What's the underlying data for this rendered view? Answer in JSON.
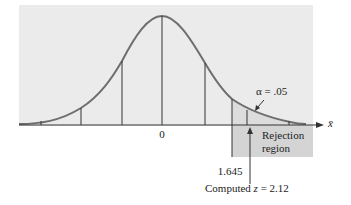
{
  "diagram": {
    "type": "normal-distribution-hypothesis-test",
    "axis_variable": "x̄",
    "center_label": "0",
    "alpha_label": "α = .05",
    "rejection_region_label_line1": "Rejection",
    "rejection_region_label_line2": "region",
    "critical_value_label": "1.645",
    "computed_label_prefix": "Computed ",
    "computed_label_var": "z",
    "computed_label_suffix": " = 2.12",
    "critical_value": 1.645,
    "computed_z": 2.12,
    "alpha": 0.05,
    "colors": {
      "panel_background": "#ebebeb",
      "rejection_region": "#d4d4d4",
      "tail_shade": "#dcdcdc",
      "curve": "#6e6e6e",
      "lines": "#333333"
    }
  }
}
